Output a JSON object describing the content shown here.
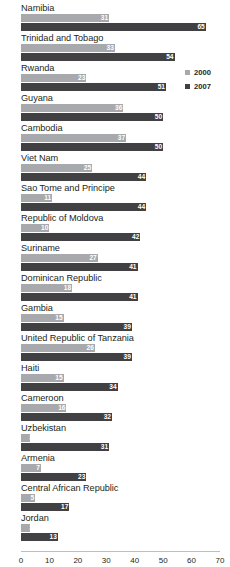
{
  "chart_data": {
    "type": "bar",
    "orientation": "horizontal",
    "title": "",
    "xlabel": "",
    "ylabel": "",
    "xlim": [
      0,
      70
    ],
    "xticks": [
      0,
      10,
      20,
      30,
      40,
      50,
      60,
      70
    ],
    "grid": false,
    "legend_position": "right-top",
    "categories": [
      "Namibia",
      "Trinidad and Tobago",
      "Rwanda",
      "Guyana",
      "Cambodia",
      "Viet Nam",
      "Sao Tome and Principe",
      "Republic of Moldova",
      "Suriname",
      "Dominican Republic",
      "Gambia",
      "United Republic of Tanzania",
      "Haiti",
      "Cameroon",
      "Uzbekistan",
      "Armenia",
      "Central African Republic",
      "Jordan"
    ],
    "series": [
      {
        "name": "2000",
        "color": "#a7a9ac",
        "values": [
          31,
          33,
          23,
          36,
          37,
          25,
          11,
          10,
          27,
          18,
          15,
          26,
          15,
          16,
          3,
          7,
          5,
          3
        ]
      },
      {
        "name": "2007",
        "color": "#414042",
        "values": [
          65,
          54,
          51,
          50,
          50,
          44,
          44,
          42,
          41,
          41,
          39,
          39,
          34,
          32,
          31,
          23,
          17,
          13
        ]
      }
    ]
  },
  "legend": {
    "items": [
      {
        "label": "2000",
        "color": "#a7a9ac"
      },
      {
        "label": "2007",
        "color": "#414042"
      }
    ]
  }
}
